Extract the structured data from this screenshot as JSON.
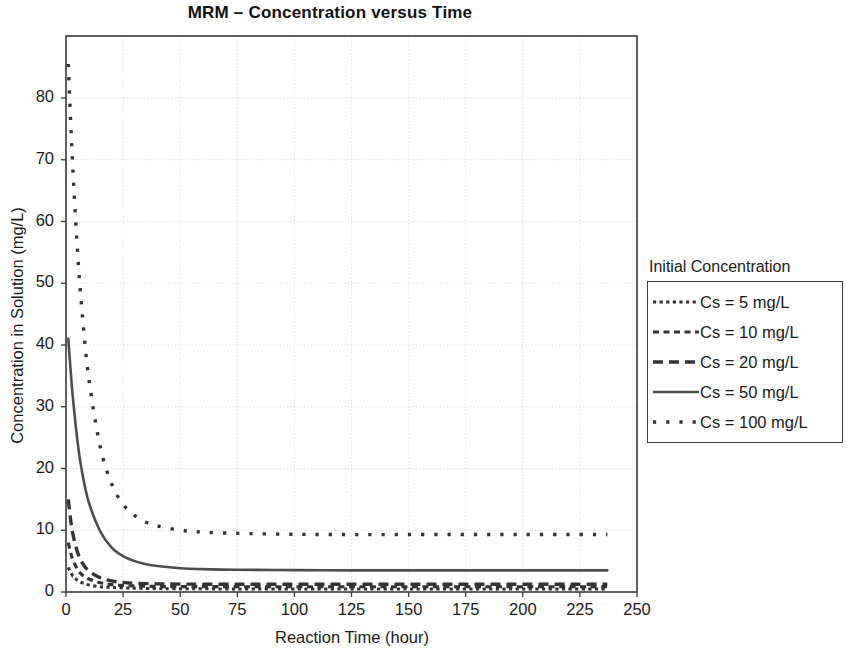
{
  "chart_data": {
    "type": "line",
    "title": "MRM – Concentration versus Time",
    "xlabel": "Reaction Time (hour)",
    "ylabel": "Concentration in Solution (mg/L)",
    "xlim": [
      0,
      250
    ],
    "ylim": [
      0,
      88
    ],
    "xticks": [
      0,
      25,
      50,
      75,
      100,
      125,
      150,
      175,
      200,
      225,
      250
    ],
    "yticks": [
      0,
      10,
      20,
      30,
      40,
      50,
      60,
      70,
      80
    ],
    "grid": true,
    "legend_position": "right-outside",
    "legend_title": "Initial Concentration",
    "series": [
      {
        "name": "Cs = 5 mg/L",
        "dash": "dotted",
        "color": "#333333",
        "x": [
          1,
          2,
          3,
          5,
          7,
          10,
          15,
          20,
          25,
          30,
          40,
          50,
          75,
          100,
          125,
          150,
          175,
          200,
          225,
          237
        ],
        "values": [
          4.0,
          3.2,
          2.6,
          1.9,
          1.5,
          1.15,
          0.85,
          0.72,
          0.65,
          0.6,
          0.55,
          0.52,
          0.5,
          0.5,
          0.5,
          0.5,
          0.5,
          0.5,
          0.5,
          0.5
        ]
      },
      {
        "name": "Cs = 10 mg/L",
        "dash": "short-dash",
        "color": "#333333",
        "x": [
          1,
          2,
          3,
          5,
          7,
          10,
          15,
          20,
          25,
          30,
          40,
          50,
          75,
          100,
          125,
          150,
          175,
          200,
          225,
          237
        ],
        "values": [
          8.0,
          6.4,
          5.2,
          3.7,
          2.8,
          2.1,
          1.5,
          1.2,
          1.05,
          0.98,
          0.9,
          0.87,
          0.85,
          0.85,
          0.85,
          0.85,
          0.85,
          0.85,
          0.85,
          0.85
        ]
      },
      {
        "name": "Cs = 20 mg/L",
        "dash": "medium-dash",
        "color": "#333333",
        "x": [
          1,
          2,
          3,
          5,
          7,
          10,
          15,
          20,
          25,
          30,
          40,
          50,
          75,
          100,
          125,
          150,
          175,
          200,
          225,
          237
        ],
        "values": [
          15.0,
          11.8,
          9.4,
          6.5,
          4.8,
          3.4,
          2.3,
          1.8,
          1.55,
          1.42,
          1.32,
          1.28,
          1.25,
          1.25,
          1.25,
          1.25,
          1.25,
          1.25,
          1.25,
          1.25
        ]
      },
      {
        "name": "Cs = 50 mg/L",
        "dash": "solid",
        "color": "#4d4d4d",
        "x": [
          1,
          2,
          3,
          5,
          7,
          10,
          15,
          20,
          25,
          30,
          35,
          40,
          50,
          60,
          75,
          100,
          125,
          150,
          175,
          200,
          225,
          237
        ],
        "values": [
          41.0,
          36.0,
          31.5,
          24.5,
          19.5,
          14.5,
          9.8,
          7.2,
          5.8,
          5.0,
          4.5,
          4.2,
          3.85,
          3.7,
          3.6,
          3.55,
          3.5,
          3.5,
          3.5,
          3.5,
          3.5,
          3.5
        ]
      },
      {
        "name": "Cs = 100 mg/L",
        "dash": "loose-dot",
        "color": "#333333",
        "x": [
          1,
          2,
          3,
          5,
          7,
          10,
          15,
          20,
          25,
          30,
          35,
          40,
          50,
          60,
          75,
          100,
          125,
          150,
          175,
          200,
          225,
          237
        ],
        "values": [
          85.5,
          76.5,
          68.5,
          55.5,
          45.5,
          34.5,
          23.5,
          17.5,
          14.2,
          12.4,
          11.3,
          10.7,
          10.0,
          9.7,
          9.5,
          9.35,
          9.3,
          9.3,
          9.3,
          9.3,
          9.3,
          9.3
        ]
      }
    ]
  },
  "legend": {
    "title": "Initial Concentration",
    "entries": [
      {
        "label": "Cs = 5 mg/L"
      },
      {
        "label": "Cs = 10 mg/L"
      },
      {
        "label": "Cs = 20 mg/L"
      },
      {
        "label": "Cs = 50 mg/L"
      },
      {
        "label": "Cs = 100 mg/L"
      }
    ]
  },
  "axes": {
    "x_tick_labels": [
      "0",
      "25",
      "50",
      "75",
      "100",
      "125",
      "150",
      "175",
      "200",
      "225",
      "250"
    ],
    "y_tick_labels": [
      "0",
      "10",
      "20",
      "30",
      "40",
      "50",
      "60",
      "70",
      "80"
    ]
  },
  "colors": {
    "frame": "#3a3a3a",
    "grid": "#d8d8d8",
    "series_dark": "#333333",
    "series_solid": "#4d4d4d",
    "text": "#1a1a1a",
    "background": "#ffffff"
  }
}
